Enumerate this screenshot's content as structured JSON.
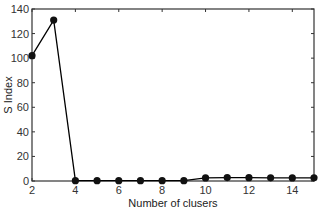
{
  "chart_data": {
    "type": "line",
    "title": "",
    "xlabel": "Number of clusers",
    "ylabel": "S Index",
    "xlim": [
      2,
      15
    ],
    "ylim": [
      0,
      140
    ],
    "xticks": [
      2,
      4,
      6,
      8,
      10,
      12,
      14
    ],
    "yticks": [
      0,
      20,
      40,
      60,
      80,
      100,
      120,
      140
    ],
    "grid": false,
    "legend": null,
    "series": [
      {
        "name": "S Index",
        "marker": "filled-circle",
        "color": "#000000",
        "x": [
          2,
          3,
          4,
          5,
          6,
          7,
          8,
          9,
          10,
          11,
          12,
          13,
          14,
          15
        ],
        "values": [
          102,
          131,
          0.3,
          0.3,
          0.3,
          0.3,
          0.3,
          0.3,
          2.5,
          2.8,
          2.7,
          2.6,
          2.5,
          2.6
        ]
      }
    ]
  }
}
